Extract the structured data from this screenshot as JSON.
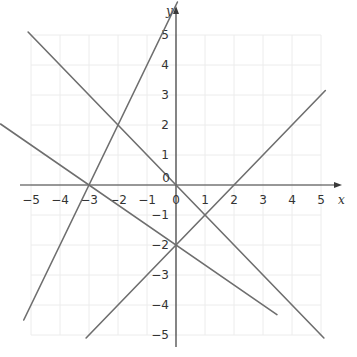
{
  "chart_data": {
    "type": "line",
    "title": "",
    "xlabel": "x",
    "ylabel": "y",
    "xlim": [
      -5,
      5
    ],
    "ylim": [
      -5,
      5
    ],
    "grid": true,
    "x_ticks": [
      -5,
      -4,
      -3,
      -2,
      -1,
      0,
      1,
      2,
      3,
      4,
      5
    ],
    "y_ticks": [
      -5,
      -4,
      -3,
      -2,
      -1,
      1,
      2,
      3,
      4,
      5
    ],
    "x_tick_labels": [
      "−5",
      "−4",
      "−3",
      "−2",
      "−1",
      "0",
      "1",
      "2",
      "3",
      "4",
      "5"
    ],
    "y_tick_labels": [
      "−5",
      "−4",
      "−3",
      "−2",
      "−1",
      "1",
      "2",
      "3",
      "4",
      "5"
    ],
    "origin_label": "0",
    "series": [
      {
        "name": "y = 2x + 6",
        "slope": 2,
        "intercept": 6,
        "x_range": [
          -5.25,
          0.05
        ],
        "color": "#6e6e6e"
      },
      {
        "name": "y = -x",
        "slope": -1,
        "intercept": 0,
        "x_range": [
          -5.1,
          5.1
        ],
        "color": "#6e6e6e"
      },
      {
        "name": "y = x - 2",
        "slope": 1,
        "intercept": -2,
        "x_range": [
          -3.1,
          5.15
        ],
        "color": "#6e6e6e"
      },
      {
        "name": "y = -2/3 x - 2",
        "slope": -0.6667,
        "intercept": -2,
        "x_range": [
          -6.05,
          3.48
        ],
        "color": "#6e6e6e"
      }
    ],
    "intersections": [
      {
        "x": -2,
        "y": 2
      },
      {
        "x": -3,
        "y": 0
      },
      {
        "x": 0,
        "y": 0
      },
      {
        "x": 2,
        "y": 0
      },
      {
        "x": 1,
        "y": -1
      },
      {
        "x": 0,
        "y": -2
      }
    ]
  }
}
